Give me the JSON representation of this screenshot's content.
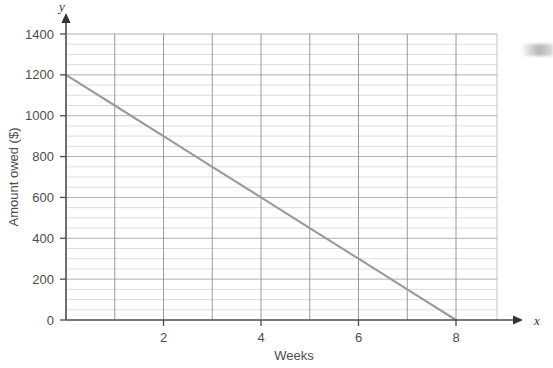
{
  "chart_data": {
    "type": "line",
    "title": "",
    "xlabel": "Weeks",
    "ylabel": "Amount owed ($)",
    "x_axis_variable": "x",
    "y_axis_variable": "y",
    "xlim": [
      0,
      8.8
    ],
    "ylim": [
      0,
      1400
    ],
    "x_ticks": [
      0,
      1,
      2,
      3,
      4,
      5,
      6,
      7,
      8
    ],
    "x_tick_labels": [
      "",
      "",
      "2",
      "",
      "4",
      "",
      "6",
      "",
      "8"
    ],
    "y_ticks": [
      0,
      200,
      400,
      600,
      800,
      1000,
      1200,
      1400
    ],
    "y_tick_labels": [
      "0",
      "200",
      "400",
      "600",
      "800",
      "1000",
      "1200",
      "1400"
    ],
    "y_minor_step": 50,
    "x_minor_step": 1,
    "grid": true,
    "legend": "none",
    "series": [
      {
        "name": "Amount owed",
        "color": "#9a9a9a",
        "x": [
          0,
          1,
          2,
          3,
          4,
          5,
          6,
          7,
          8
        ],
        "values": [
          1200,
          1050,
          900,
          750,
          600,
          450,
          300,
          150,
          0
        ]
      }
    ],
    "annotations": []
  },
  "labels": {
    "y_axis_title": "Amount owed ($)",
    "x_axis_title": "Weeks",
    "y_axis_symbol": "y",
    "x_axis_symbol": "x",
    "x_tick_2": "2",
    "x_tick_4": "4",
    "x_tick_6": "6",
    "x_tick_8": "8",
    "y_tick_0": "0",
    "y_tick_200": "200",
    "y_tick_400": "400",
    "y_tick_600": "600",
    "y_tick_800": "800",
    "y_tick_1000": "1000",
    "y_tick_1200": "1200",
    "y_tick_1400": "1400"
  },
  "colors": {
    "line": "#9a9a9a",
    "axis": "#4d4d4d",
    "major_grid": "#8e8e8e",
    "minor_grid": "#d0d0d0",
    "text": "#4d4d4d",
    "background": "#ffffff"
  }
}
